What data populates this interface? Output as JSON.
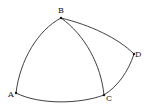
{
  "diagram": {
    "type": "spherical-geometry",
    "points": [
      {
        "id": "A",
        "label": "A",
        "x": 16,
        "y": 93
      },
      {
        "id": "B",
        "label": "B",
        "x": 61,
        "y": 18
      },
      {
        "id": "C",
        "label": "C",
        "x": 104,
        "y": 95
      },
      {
        "id": "D",
        "label": "D",
        "x": 134,
        "y": 54
      }
    ],
    "arcs": [
      {
        "from": "A",
        "to": "B"
      },
      {
        "from": "B",
        "to": "C"
      },
      {
        "from": "A",
        "to": "C"
      },
      {
        "from": "B",
        "to": "D"
      },
      {
        "from": "D",
        "to": "C"
      }
    ],
    "labels": {
      "A": "A",
      "B": "B",
      "C": "C",
      "D": "D"
    },
    "colors": {
      "stroke": "#2a2a2a",
      "background": "#ffffff"
    }
  }
}
